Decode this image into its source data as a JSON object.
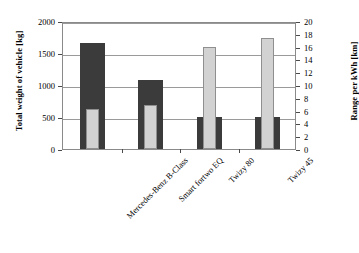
{
  "chart_data": {
    "type": "bar",
    "title": "",
    "subtitle": "",
    "orientation": "vertical",
    "grid": true,
    "legend": "none",
    "categories": [
      "Mercedes-Benz B-Class",
      "Smart fortwo EQ",
      "Twizy 80",
      "Twizy 45"
    ],
    "xlabel": "",
    "series": [
      {
        "name": "Total weight of vehicle",
        "axis": "left",
        "unit": "kg",
        "color": "#3b3b3b",
        "values": [
          1655,
          1085,
          500,
          500
        ]
      },
      {
        "name": "Range per kWh",
        "axis": "right",
        "unit": "km",
        "color": "#d2d2d2",
        "values": [
          6.3,
          6.8,
          15.9,
          17.3
        ]
      }
    ],
    "axes": {
      "left": {
        "label": "Total weight of vehicle [kg]",
        "min": 0,
        "max": 2000,
        "step": 500,
        "ticks": [
          "0",
          "500",
          "1000",
          "1500",
          "2000"
        ],
        "tick_values": [
          0,
          500,
          1000,
          1500,
          2000
        ]
      },
      "right": {
        "label": "Range per kWh [km]",
        "min": 0,
        "max": 20,
        "step": 2,
        "ticks": [
          "0",
          "2",
          "4",
          "6",
          "8",
          "10",
          "12",
          "14",
          "16",
          "18",
          "20"
        ],
        "tick_values": [
          0,
          2,
          4,
          6,
          8,
          10,
          12,
          14,
          16,
          18,
          20
        ]
      }
    },
    "gridline_values_left": [
      500,
      1000,
      1500,
      2000
    ]
  }
}
